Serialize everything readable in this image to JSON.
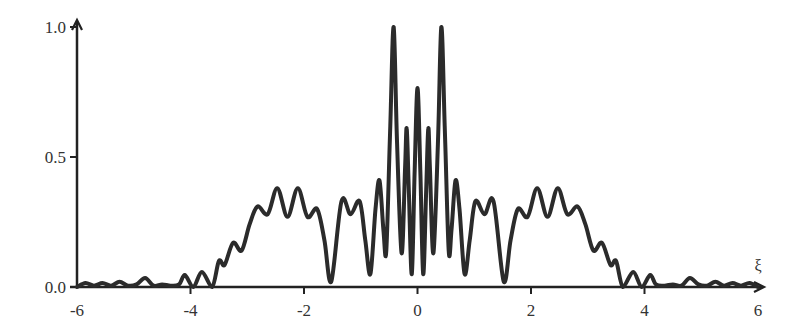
{
  "chart_data": {
    "type": "line",
    "title": "",
    "xlabel": "ξ",
    "ylabel": "",
    "xlim": [
      -6,
      6
    ],
    "ylim": [
      0,
      1.0
    ],
    "grid": false,
    "legend": null,
    "x_ticks": [
      "-6",
      "-4",
      "-2",
      "0",
      "2",
      "4",
      "6"
    ],
    "x_tick_values": [
      -6,
      -4,
      -2,
      0,
      2,
      4,
      6
    ],
    "y_ticks": [
      "0.0",
      "0.5",
      "1.0"
    ],
    "y_tick_values": [
      0,
      0.5,
      1.0
    ],
    "line_color": "#2b2b2b",
    "series": [
      {
        "name": "intensity",
        "x": [
          -6.0,
          -5.85,
          -5.7,
          -5.55,
          -5.4,
          -5.25,
          -5.1,
          -4.95,
          -4.8,
          -4.65,
          -4.5,
          -4.35,
          -4.2,
          -4.1,
          -3.95,
          -3.8,
          -3.62,
          -3.5,
          -3.4,
          -3.25,
          -3.1,
          -2.96,
          -2.82,
          -2.64,
          -2.47,
          -2.29,
          -2.11,
          -1.94,
          -1.77,
          -1.64,
          -1.52,
          -1.34,
          -1.18,
          -1.02,
          -0.92,
          -0.83,
          -0.74,
          -0.67,
          -0.6,
          -0.55,
          -0.48,
          -0.42,
          -0.36,
          -0.28,
          -0.22,
          -0.19,
          -0.15,
          -0.1,
          -0.05,
          0.0,
          0.05,
          0.1,
          0.15,
          0.19,
          0.22,
          0.28,
          0.36,
          0.42,
          0.48,
          0.55,
          0.6,
          0.67,
          0.74,
          0.83,
          0.92,
          1.02,
          1.18,
          1.34,
          1.52,
          1.64,
          1.77,
          1.94,
          2.11,
          2.29,
          2.47,
          2.64,
          2.82,
          2.96,
          3.1,
          3.25,
          3.4,
          3.5,
          3.62,
          3.8,
          3.95,
          4.1,
          4.2,
          4.35,
          4.5,
          4.65,
          4.8,
          4.95,
          5.1,
          5.25,
          5.4,
          5.55,
          5.7,
          5.85,
          6.0
        ],
        "y": [
          0.0,
          0.015,
          0.005,
          0.015,
          0.005,
          0.02,
          0.005,
          0.01,
          0.035,
          0.005,
          0.01,
          0.005,
          0.01,
          0.046,
          0.0,
          0.058,
          0.0,
          0.1,
          0.085,
          0.17,
          0.14,
          0.24,
          0.31,
          0.28,
          0.38,
          0.27,
          0.38,
          0.27,
          0.3,
          0.18,
          0.02,
          0.33,
          0.28,
          0.33,
          0.18,
          0.05,
          0.3,
          0.41,
          0.22,
          0.14,
          0.62,
          1.0,
          0.55,
          0.13,
          0.45,
          0.61,
          0.35,
          0.05,
          0.45,
          0.765,
          0.45,
          0.05,
          0.35,
          0.61,
          0.45,
          0.13,
          0.55,
          1.0,
          0.62,
          0.14,
          0.22,
          0.41,
          0.3,
          0.05,
          0.18,
          0.33,
          0.28,
          0.33,
          0.02,
          0.18,
          0.3,
          0.27,
          0.38,
          0.27,
          0.38,
          0.28,
          0.31,
          0.24,
          0.14,
          0.17,
          0.085,
          0.1,
          0.0,
          0.058,
          0.0,
          0.046,
          0.01,
          0.005,
          0.01,
          0.005,
          0.035,
          0.01,
          0.005,
          0.02,
          0.005,
          0.015,
          0.005,
          0.015,
          0.0
        ]
      }
    ]
  }
}
